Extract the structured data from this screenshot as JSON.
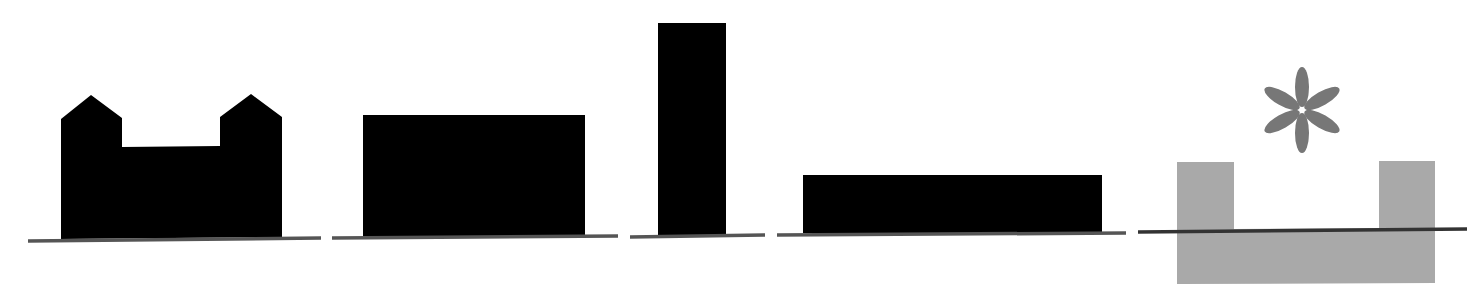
{
  "diagram": {
    "colors": {
      "fill": "#000000",
      "ground": "#555555",
      "highlight_fill": "#aaaaaa",
      "asterisk": "#777777",
      "background": "#ffffff"
    },
    "figures": [
      {
        "id": "twin-gabled",
        "label": "two towers with pitched roofs joined by lower block"
      },
      {
        "id": "wide-block",
        "label": "wide medium-height block"
      },
      {
        "id": "tall-tower",
        "label": "tall narrow tower"
      },
      {
        "id": "long-low",
        "label": "long low block"
      },
      {
        "id": "sunken-u",
        "label": "grey U-shape partially below ground with asterisk marker"
      }
    ],
    "marker": "asterisk"
  }
}
